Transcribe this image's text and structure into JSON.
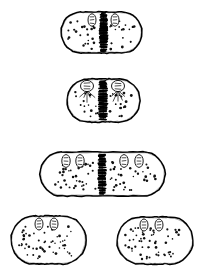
{
  "figure": {
    "style": "black ink line drawing, stippled shading",
    "background_color": "#ffffff",
    "ink_color": "#000000",
    "canvas": {
      "width": 203,
      "height": 269
    },
    "panel_count": 5
  },
  "panels": [
    {
      "id": "panel-1",
      "name": "cell-stage-1",
      "label": "",
      "stage_description": "elongated cell with dense central septum band and two nucleoid ovals at top",
      "shape": "capsule",
      "box": {
        "x": 61,
        "y": 12,
        "width": 81,
        "height": 41
      },
      "corner_radius": 20,
      "stroke_width": 1.6,
      "organelles": [
        {
          "name": "nucleoid-oval-left",
          "cx": 92,
          "cy": 20,
          "rx": 4.0,
          "ry": 6.2,
          "rotation": 0
        },
        {
          "name": "nucleoid-oval-right",
          "cx": 115,
          "cy": 20,
          "rx": 4.0,
          "ry": 6.2,
          "rotation": 0
        }
      ],
      "septum": {
        "present": true,
        "x": 103.5,
        "y_top": 13,
        "y_bottom": 52,
        "density": "very-high",
        "width": 7
      },
      "stipple": {
        "count": 52,
        "regions": [
          {
            "x": 66,
            "y": 20,
            "width": 32,
            "height": 30,
            "n": 26
          },
          {
            "x": 110,
            "y": 20,
            "width": 30,
            "height": 30,
            "n": 26
          }
        ]
      },
      "spindle_fibers": {
        "present": false,
        "count": 0
      }
    },
    {
      "id": "panel-2",
      "name": "cell-stage-2",
      "label": "",
      "stage_description": "cell with two domed nucleoids with radiating spindle fibers and central chromatin band",
      "shape": "capsule",
      "box": {
        "x": 67,
        "y": 79,
        "width": 73,
        "height": 43
      },
      "corner_radius": 21,
      "stroke_width": 1.6,
      "organelles": [
        {
          "name": "nucleoid-oval-left",
          "cx": 87,
          "cy": 86,
          "rx": 6.5,
          "ry": 5.6,
          "rotation": 0
        },
        {
          "name": "nucleoid-oval-right",
          "cx": 118,
          "cy": 86,
          "rx": 6.5,
          "ry": 5.6,
          "rotation": 0
        }
      ],
      "septum": {
        "present": true,
        "x": 103,
        "y_top": 81,
        "y_bottom": 120,
        "density": "high",
        "width": 8
      },
      "stipple": {
        "count": 46,
        "regions": [
          {
            "x": 71,
            "y": 92,
            "width": 27,
            "height": 26,
            "n": 22
          },
          {
            "x": 110,
            "y": 92,
            "width": 27,
            "height": 26,
            "n": 24
          }
        ]
      },
      "spindle_fibers": {
        "present": true,
        "count": 10,
        "description": "fan of short lines below each nucleoid"
      }
    },
    {
      "id": "panel-3",
      "name": "cell-stage-3",
      "label": "",
      "stage_description": "long elongated cell with four nucleoid ovals (two pairs) and central septum band",
      "shape": "capsule",
      "box": {
        "x": 40,
        "y": 152,
        "width": 125,
        "height": 44
      },
      "corner_radius": 22,
      "stroke_width": 1.6,
      "organelles": [
        {
          "name": "nucleoid-oval-1",
          "cx": 66,
          "cy": 161,
          "rx": 4.2,
          "ry": 6.4,
          "rotation": 0
        },
        {
          "name": "nucleoid-oval-2",
          "cx": 80,
          "cy": 161,
          "rx": 4.2,
          "ry": 6.4,
          "rotation": 0
        },
        {
          "name": "nucleoid-oval-3",
          "cx": 124,
          "cy": 161,
          "rx": 4.2,
          "ry": 6.4,
          "rotation": 0
        },
        {
          "name": "nucleoid-oval-4",
          "cx": 139,
          "cy": 161,
          "rx": 4.2,
          "ry": 6.4,
          "rotation": 0
        }
      ],
      "septum": {
        "present": true,
        "x": 102,
        "y_top": 154,
        "y_bottom": 195,
        "density": "high",
        "width": 7
      },
      "stipple": {
        "count": 88,
        "regions": [
          {
            "x": 46,
            "y": 162,
            "width": 50,
            "height": 30,
            "n": 44
          },
          {
            "x": 110,
            "y": 162,
            "width": 50,
            "height": 30,
            "n": 44
          }
        ]
      },
      "spindle_fibers": {
        "present": false,
        "count": 0
      }
    },
    {
      "id": "panel-4",
      "name": "cell-stage-4-daughter-left",
      "label": "",
      "stage_description": "separated daughter cell with two nucleoid ovals at top and dense stippling",
      "shape": "capsule",
      "box": {
        "x": 11,
        "y": 216,
        "width": 75,
        "height": 48
      },
      "corner_radius": 23,
      "stroke_width": 1.6,
      "organelles": [
        {
          "name": "nucleoid-oval-left",
          "cx": 39,
          "cy": 224,
          "rx": 4.0,
          "ry": 6.0,
          "rotation": 0
        },
        {
          "name": "nucleoid-oval-right",
          "cx": 54,
          "cy": 224,
          "rx": 4.0,
          "ry": 6.0,
          "rotation": 0
        }
      ],
      "septum": {
        "present": false,
        "x": 0,
        "y_top": 0,
        "y_bottom": 0,
        "density": "none",
        "width": 0
      },
      "stipple": {
        "count": 62,
        "regions": [
          {
            "x": 18,
            "y": 226,
            "width": 56,
            "height": 33,
            "n": 62
          }
        ]
      },
      "spindle_fibers": {
        "present": false,
        "count": 0
      }
    },
    {
      "id": "panel-5",
      "name": "cell-stage-4-daughter-right",
      "label": "",
      "stage_description": "separated daughter cell with two nucleoid ovals at top and dense stippling",
      "shape": "capsule",
      "box": {
        "x": 117,
        "y": 217,
        "width": 76,
        "height": 47
      },
      "corner_radius": 23,
      "stroke_width": 1.6,
      "organelles": [
        {
          "name": "nucleoid-oval-left",
          "cx": 144,
          "cy": 225,
          "rx": 4.0,
          "ry": 6.0,
          "rotation": 0
        },
        {
          "name": "nucleoid-oval-right",
          "cx": 159,
          "cy": 225,
          "rx": 4.0,
          "ry": 6.0,
          "rotation": 0
        }
      ],
      "septum": {
        "present": false,
        "x": 0,
        "y_top": 0,
        "y_bottom": 0,
        "density": "none",
        "width": 0
      },
      "stipple": {
        "count": 62,
        "regions": [
          {
            "x": 124,
            "y": 227,
            "width": 56,
            "height": 32,
            "n": 62
          }
        ]
      },
      "spindle_fibers": {
        "present": false,
        "count": 0
      }
    }
  ]
}
